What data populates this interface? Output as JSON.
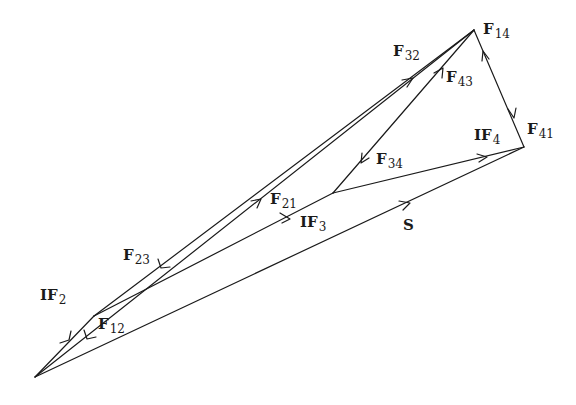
{
  "diagram": {
    "type": "force-polygon",
    "stroke_color": "#1a1a1a",
    "background": "#ffffff",
    "points": {
      "A": [
        35,
        377
      ],
      "B": [
        94,
        316
      ],
      "J": [
        333,
        193
      ],
      "T": [
        474,
        30
      ],
      "C": [
        524,
        147
      ]
    },
    "labels": [
      {
        "id": "F14",
        "base": "F",
        "sub": "14",
        "x": 483,
        "y": 22
      },
      {
        "id": "F32",
        "base": "F",
        "sub": "32",
        "x": 393,
        "y": 44
      },
      {
        "id": "F43",
        "base": "F",
        "sub": "43",
        "x": 446,
        "y": 70
      },
      {
        "id": "IF4",
        "base": "IF",
        "sub": "4",
        "x": 474,
        "y": 128
      },
      {
        "id": "F41",
        "base": "F",
        "sub": "41",
        "x": 527,
        "y": 122
      },
      {
        "id": "F34",
        "base": "F",
        "sub": "34",
        "x": 376,
        "y": 152
      },
      {
        "id": "F21",
        "base": "F",
        "sub": "21",
        "x": 270,
        "y": 192
      },
      {
        "id": "IF3",
        "base": "IF",
        "sub": "3",
        "x": 300,
        "y": 215
      },
      {
        "id": "S",
        "base": "S",
        "sub": "",
        "x": 403,
        "y": 218
      },
      {
        "id": "F23",
        "base": "F",
        "sub": "23",
        "x": 123,
        "y": 248
      },
      {
        "id": "IF2",
        "base": "IF",
        "sub": "2",
        "x": 40,
        "y": 288
      },
      {
        "id": "F12",
        "base": "F",
        "sub": "12",
        "x": 98,
        "y": 317
      }
    ]
  }
}
